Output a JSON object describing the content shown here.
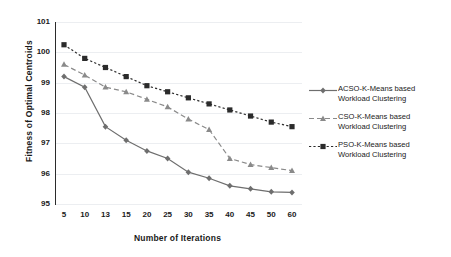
{
  "chart_data": {
    "type": "line",
    "title": "",
    "xlabel": "Number of Iterations",
    "ylabel": "Fitness of Optimal Centroids",
    "categories": [
      "5",
      "10",
      "13",
      "15",
      "20",
      "25",
      "30",
      "35",
      "40",
      "45",
      "50",
      "60"
    ],
    "yticks": [
      "101",
      "100",
      "99",
      "98",
      "97",
      "96",
      "95"
    ],
    "ylim": [
      95,
      101
    ],
    "grid": true,
    "legend_position": "right",
    "series": [
      {
        "name": "ACSO-K-Means based Workload Clustering",
        "marker": "diamond",
        "linestyle": "solid",
        "color": "#6e6e6e",
        "values": [
          99.2,
          98.85,
          97.55,
          97.1,
          96.75,
          96.5,
          96.05,
          95.85,
          95.6,
          95.5,
          95.4,
          95.38
        ]
      },
      {
        "name": "CSO-K-Means based Workload Clustering",
        "marker": "triangle",
        "linestyle": "dashed",
        "color": "#8a8a8a",
        "values": [
          99.6,
          99.25,
          98.85,
          98.7,
          98.45,
          98.2,
          97.8,
          97.45,
          96.5,
          96.3,
          96.2,
          96.1
        ]
      },
      {
        "name": "PSO-K-Means based Workload Clustering",
        "marker": "square",
        "linestyle": "dotted",
        "color": "#2b2b2b",
        "values": [
          100.25,
          99.8,
          99.5,
          99.2,
          98.9,
          98.7,
          98.5,
          98.3,
          98.1,
          97.9,
          97.7,
          97.55
        ]
      }
    ]
  },
  "legend": {
    "items": [
      {
        "line1": "ACSO-K-Means based",
        "line2": "Workload Clustering"
      },
      {
        "line1": "CSO-K-Means based",
        "line2": "Workload Clustering"
      },
      {
        "line1": "PSO-K-Means based",
        "line2": "Workload Clustering"
      }
    ]
  }
}
